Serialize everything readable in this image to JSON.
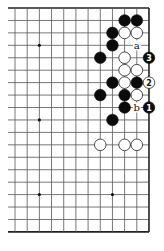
{
  "diagram": {
    "type": "go-board-fragment",
    "board_size": 19,
    "visible_columns": 12,
    "visible_rows": 19,
    "edges": {
      "top": true,
      "bottom": true,
      "right": true,
      "left": false
    },
    "colors": {
      "black": "#0b0b0b",
      "white": "#ffffff",
      "line": "#555555"
    },
    "hoshi": [
      {
        "col": 2,
        "row": 3
      },
      {
        "col": 8,
        "row": 3
      },
      {
        "col": 2,
        "row": 9
      },
      {
        "col": 8,
        "row": 9
      },
      {
        "col": 2,
        "row": 15
      },
      {
        "col": 8,
        "row": 15
      }
    ],
    "stones": [
      {
        "color": "black",
        "col": 9,
        "row": 1
      },
      {
        "color": "black",
        "col": 10,
        "row": 1
      },
      {
        "color": "black",
        "col": 8,
        "row": 2
      },
      {
        "color": "white",
        "col": 9,
        "row": 2
      },
      {
        "color": "white",
        "col": 10,
        "row": 2
      },
      {
        "color": "black",
        "col": 8,
        "row": 3
      },
      {
        "color": "black",
        "col": 7,
        "row": 4
      },
      {
        "color": "white",
        "col": 9,
        "row": 4
      },
      {
        "color": "black",
        "col": 11,
        "row": 4,
        "label": "3"
      },
      {
        "color": "white",
        "col": 9,
        "row": 5
      },
      {
        "color": "white",
        "col": 10,
        "row": 5
      },
      {
        "color": "black",
        "col": 8,
        "row": 6
      },
      {
        "color": "white",
        "col": 9,
        "row": 6
      },
      {
        "color": "black",
        "col": 10,
        "row": 6
      },
      {
        "color": "white",
        "col": 11,
        "row": 6,
        "label": "2"
      },
      {
        "color": "black",
        "col": 7,
        "row": 7
      },
      {
        "color": "black",
        "col": 9,
        "row": 7
      },
      {
        "color": "white",
        "col": 10,
        "row": 7
      },
      {
        "color": "black",
        "col": 9,
        "row": 8
      },
      {
        "color": "black",
        "col": 11,
        "row": 8,
        "label": "1"
      },
      {
        "color": "black",
        "col": 8,
        "row": 9
      },
      {
        "color": "white",
        "col": 7,
        "row": 11
      },
      {
        "color": "white",
        "col": 9,
        "row": 11
      },
      {
        "color": "white",
        "col": 10,
        "row": 11
      }
    ],
    "point_labels": [
      {
        "text": "a",
        "col": 10,
        "row": 3
      },
      {
        "text": "b",
        "col": 10,
        "row": 8
      }
    ]
  }
}
